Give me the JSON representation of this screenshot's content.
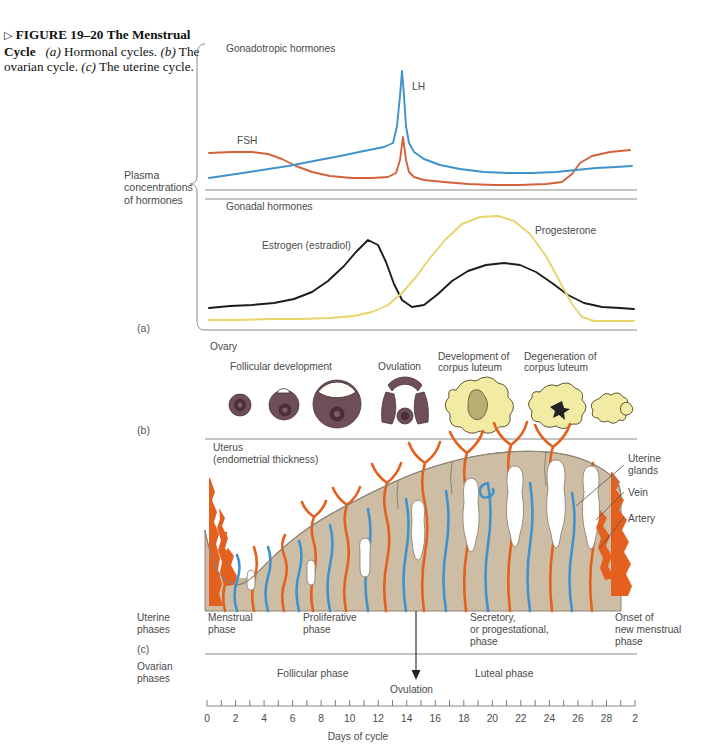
{
  "caption": {
    "triangle": "▷",
    "fig_number": "FIGURE 19–20",
    "title": "The Menstrual Cycle",
    "part_a": "(a)",
    "part_a_text": "Hormonal cycles.",
    "part_b": "(b)",
    "part_b_text": "The ovarian cycle.",
    "part_c": "(c)",
    "part_c_text": "The uterine cycle."
  },
  "panel_labels": {
    "a": "(a)",
    "b": "(b)",
    "c": "(c)"
  },
  "panel_a": {
    "bracket_label": "Plasma\nconcentrations\nof hormones",
    "top_title": "Gonadotropic hormones",
    "bottom_title": "Gonadal hormones",
    "series_labels": {
      "fsh": "FSH",
      "lh": "LH",
      "estrogen": "Estrogen (estradiol)",
      "progesterone": "Progesterone"
    },
    "colors": {
      "fsh": "#d4613c",
      "lh": "#3f92cb",
      "estrogen": "#1c1c1c",
      "progesterone": "#e8d46a"
    }
  },
  "panel_b": {
    "title": "Ovary",
    "stages": [
      {
        "label": "Follicular development"
      },
      {
        "label": "Ovulation"
      },
      {
        "label": "Development of\ncorpus luteum"
      },
      {
        "label": "Degeneration of\ncorpus luteum"
      }
    ],
    "colors": {
      "follicle": "#6e4f58",
      "corpus_luteum": "#f2eba4"
    }
  },
  "panel_c": {
    "title": "Uterus\n(endometrial thickness)",
    "annotations": [
      {
        "label": "Uterine\nglands"
      },
      {
        "label": "Vein"
      },
      {
        "label": "Artery"
      }
    ],
    "colors": {
      "artery": "#e3601f",
      "vein": "#3f92cb",
      "gland": "#ffffff",
      "endometrium": "#cdbda4"
    }
  },
  "phases": {
    "uterine_heading": "Uterine\nphases",
    "ovarian_heading": "Ovarian\nphases",
    "uterine": [
      {
        "label": "Menstrual\nphase"
      },
      {
        "label": "Proliferative\nphase"
      },
      {
        "label": "Secretory,\nor progestational,\nphase"
      },
      {
        "label": "Onset of\nnew menstrual\nphase"
      }
    ],
    "ovarian": [
      {
        "label": "Follicular phase"
      },
      {
        "label": "Luteal phase"
      }
    ],
    "ovulation_marker": "Ovulation"
  },
  "axis": {
    "title": "Days of cycle",
    "tick_labels": [
      "0",
      "2",
      "4",
      "6",
      "8",
      "10",
      "12",
      "14",
      "16",
      "18",
      "20",
      "22",
      "24",
      "26",
      "28",
      "2"
    ],
    "min_day": 0,
    "max_day": 30
  },
  "chart_data": {
    "type": "line",
    "title": "The Menstrual Cycle",
    "xlabel": "Days of cycle",
    "ylabel": "Plasma concentrations of hormones",
    "xlim": [
      0,
      30
    ],
    "grid": false,
    "legend": "inline-labels",
    "x": [
      0,
      1,
      2,
      3,
      4,
      5,
      6,
      7,
      8,
      9,
      10,
      11,
      12,
      13,
      14,
      15,
      16,
      17,
      18,
      19,
      20,
      21,
      22,
      23,
      24,
      25,
      26,
      27,
      28,
      29,
      30
    ],
    "series": [
      {
        "name": "FSH",
        "color": "#d4613c",
        "units": "relative",
        "values": [
          32,
          32,
          32,
          32,
          31,
          30,
          27,
          24,
          21,
          19,
          18,
          18,
          19,
          28,
          62,
          30,
          19,
          15,
          13,
          12,
          11,
          11,
          11,
          11,
          12,
          16,
          30,
          40,
          43,
          45,
          46
        ]
      },
      {
        "name": "LH",
        "color": "#3f92cb",
        "units": "relative",
        "values": [
          12,
          14,
          16,
          18,
          20,
          22,
          24,
          26,
          28,
          30,
          32,
          34,
          36,
          48,
          96,
          46,
          30,
          25,
          22,
          20,
          19,
          18,
          18,
          18,
          18,
          19,
          20,
          22,
          24,
          26,
          27
        ]
      },
      {
        "name": "Estrogen (estradiol)",
        "color": "#1c1c1c",
        "units": "relative",
        "values": [
          10,
          10,
          10,
          11,
          12,
          14,
          17,
          21,
          27,
          36,
          48,
          62,
          74,
          78,
          66,
          38,
          22,
          20,
          26,
          36,
          46,
          54,
          58,
          58,
          54,
          44,
          30,
          19,
          14,
          12,
          11
        ]
      },
      {
        "name": "Progesterone",
        "color": "#e8d46a",
        "units": "relative",
        "values": [
          3,
          3,
          3,
          3,
          3,
          3,
          3,
          3,
          3,
          4,
          4,
          5,
          6,
          8,
          12,
          22,
          40,
          62,
          80,
          92,
          98,
          100,
          98,
          92,
          80,
          60,
          34,
          14,
          6,
          5,
          5
        ]
      }
    ],
    "events": [
      {
        "name": "Ovulation",
        "day": 14
      }
    ],
    "phase_spans": {
      "uterine": [
        {
          "name": "Menstrual phase",
          "start": 0,
          "end": 5
        },
        {
          "name": "Proliferative phase",
          "start": 5,
          "end": 14
        },
        {
          "name": "Secretory, or progestational, phase",
          "start": 14,
          "end": 28
        },
        {
          "name": "Onset of new menstrual phase",
          "start": 28,
          "end": 30
        }
      ],
      "ovarian": [
        {
          "name": "Follicular phase",
          "start": 0,
          "end": 14
        },
        {
          "name": "Luteal phase",
          "start": 14,
          "end": 30
        }
      ]
    },
    "endometrial_thickness": {
      "units": "relative",
      "x": [
        0,
        2,
        4,
        5,
        7,
        9,
        11,
        13,
        15,
        17,
        19,
        21,
        23,
        25,
        27,
        28,
        29,
        30
      ],
      "values": [
        40,
        18,
        6,
        5,
        14,
        26,
        38,
        50,
        62,
        72,
        80,
        86,
        88,
        88,
        86,
        82,
        70,
        55
      ]
    }
  }
}
